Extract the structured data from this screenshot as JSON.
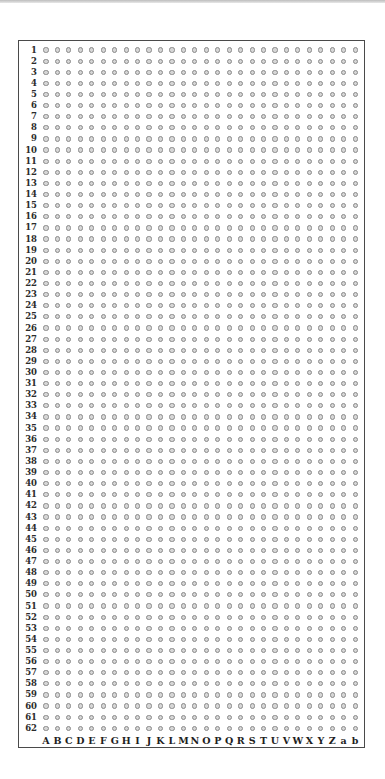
{
  "grid": {
    "rows": [
      "1",
      "2",
      "3",
      "4",
      "5",
      "6",
      "7",
      "8",
      "9",
      "10",
      "11",
      "12",
      "13",
      "14",
      "15",
      "16",
      "17",
      "18",
      "19",
      "20",
      "21",
      "22",
      "23",
      "24",
      "25",
      "26",
      "27",
      "28",
      "29",
      "30",
      "31",
      "32",
      "33",
      "34",
      "35",
      "36",
      "37",
      "38",
      "39",
      "40",
      "41",
      "42",
      "43",
      "44",
      "45",
      "46",
      "47",
      "48",
      "49",
      "50",
      "51",
      "52",
      "53",
      "54",
      "55",
      "56",
      "57",
      "58",
      "59",
      "60",
      "61",
      "62"
    ],
    "columns": [
      "A",
      "B",
      "C",
      "D",
      "E",
      "F",
      "G",
      "H",
      "I",
      "J",
      "K",
      "L",
      "M",
      "N",
      "O",
      "P",
      "Q",
      "R",
      "S",
      "T",
      "U",
      "V",
      "W",
      "X",
      "Y",
      "Z",
      "a",
      "b"
    ],
    "cell_mark": "small-open-circle",
    "colors": {
      "border": "#4a4a4a",
      "dot_fill": "#d6d6d6",
      "dot_stroke": "#8a8a8a",
      "label_text": "#2b2b2b"
    }
  }
}
